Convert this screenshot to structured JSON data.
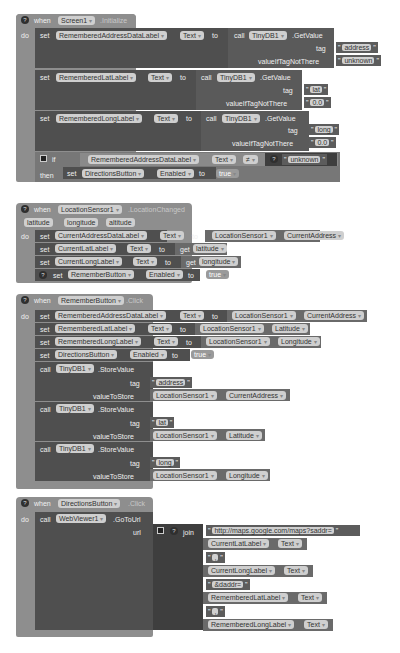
{
  "blocks": {
    "screen_init": {
      "when": "when",
      "component": "Screen1",
      "event": ".Initialize",
      "do": "do",
      "set_address": {
        "set": "set",
        "component": "RememberedAddressDataLabel",
        "prop": "Text",
        "to": "to",
        "call": "call",
        "db": "TinyDB1",
        "method": ".GetValue",
        "tag_label": "tag",
        "tag": "address",
        "vitnt_label": "valueIfTagNotThere",
        "vitnt": "unknown"
      },
      "set_lat": {
        "set": "set",
        "component": "RememberedLatLabel",
        "prop": "Text",
        "to": "to",
        "call": "call",
        "db": "TinyDB1",
        "method": ".GetValue",
        "tag_label": "tag",
        "tag": "lat",
        "vitnt_label": "valueIfTagNotThere",
        "vitnt": "0.0"
      },
      "set_long": {
        "set": "set",
        "component": "RememberedLongLabel",
        "prop": "Text",
        "to": "to",
        "call": "call",
        "db": "TinyDB1",
        "method": ".GetValue",
        "tag_label": "tag",
        "tag": "long",
        "vitnt_label": "valueIfTagNotThere",
        "vitnt": "0.0"
      },
      "if_block": {
        "if": "if",
        "then": "then",
        "component": "RememberedAddressDataLabel",
        "prop": "Text",
        "op": "≠",
        "compare": "unknown",
        "set": "set",
        "target": "DirectionsButton",
        "target_prop": "Enabled",
        "to": "to",
        "value": "true"
      }
    },
    "location_changed": {
      "when": "when",
      "component": "LocationSensor1",
      "event": ".LocationChanged",
      "params": [
        "latitude",
        "longitude",
        "altitude"
      ],
      "do": "do",
      "rows": [
        {
          "set": "set",
          "component": "CurrentAddressDataLabel",
          "prop": "Text",
          "to": "to",
          "src": "LocationSensor1",
          "src_prop": "CurrentAddress"
        },
        {
          "set": "set",
          "component": "CurrentLatLabel",
          "prop": "Text",
          "to": "to",
          "get": "get",
          "var": "latitude"
        },
        {
          "set": "set",
          "component": "CurrentLongLabel",
          "prop": "Text",
          "to": "to",
          "get": "get",
          "var": "longitude"
        },
        {
          "set": "set",
          "component": "RememberButton",
          "prop": "Enabled",
          "to": "to",
          "value": "true"
        }
      ]
    },
    "remember_click": {
      "when": "when",
      "component": "RememberButton",
      "event": ".Click",
      "do": "do",
      "sets": [
        {
          "set": "set",
          "component": "RememberedAddressDataLabel",
          "prop": "Text",
          "to": "to",
          "src": "LocationSensor1",
          "src_prop": "CurrentAddress"
        },
        {
          "set": "set",
          "component": "RememberedLatLabel",
          "prop": "Text",
          "to": "to",
          "src": "LocationSensor1",
          "src_prop": "Latitude"
        },
        {
          "set": "set",
          "component": "RememberedLongLabel",
          "prop": "Text",
          "to": "to",
          "src": "LocationSensor1",
          "src_prop": "Longitude"
        },
        {
          "set": "set",
          "component": "DirectionsButton",
          "prop": "Enabled",
          "to": "to",
          "value": "true"
        }
      ],
      "stores": [
        {
          "call": "call",
          "db": "TinyDB1",
          "method": ".StoreValue",
          "tag_label": "tag",
          "tag": "address",
          "vts_label": "valueToStore",
          "src": "LocationSensor1",
          "src_prop": "CurrentAddress"
        },
        {
          "call": "call",
          "db": "TinyDB1",
          "method": ".StoreValue",
          "tag_label": "tag",
          "tag": "lat",
          "vts_label": "valueToStore",
          "src": "LocationSensor1",
          "src_prop": "Latitude"
        },
        {
          "call": "call",
          "db": "TinyDB1",
          "method": ".StoreValue",
          "tag_label": "tag",
          "tag": "long",
          "vts_label": "valueToStore",
          "src": "LocationSensor1",
          "src_prop": "Longitude"
        }
      ]
    },
    "directions_click": {
      "when": "when",
      "component": "DirectionsButton",
      "event": ".Click",
      "do": "do",
      "call": "call",
      "viewer": "WebViewer1",
      "method": ".GoToUrl",
      "url_label": "url",
      "join": "join",
      "parts": [
        {
          "type": "string",
          "value": "http://maps.google.com/maps?saddr="
        },
        {
          "type": "prop",
          "component": "CurrentLatLabel",
          "prop": "Text"
        },
        {
          "type": "string",
          "value": ","
        },
        {
          "type": "prop",
          "component": "CurrentLongLabel",
          "prop": "Text"
        },
        {
          "type": "string",
          "value": "&daddr="
        },
        {
          "type": "prop",
          "component": "RememberedLatLabel",
          "prop": "Text"
        },
        {
          "type": "string",
          "value": ","
        },
        {
          "type": "prop",
          "component": "RememberedLongLabel",
          "prop": "Text"
        }
      ]
    }
  },
  "icons": {
    "help": "?",
    "dropdown": "▾",
    "gear": "⚙"
  }
}
